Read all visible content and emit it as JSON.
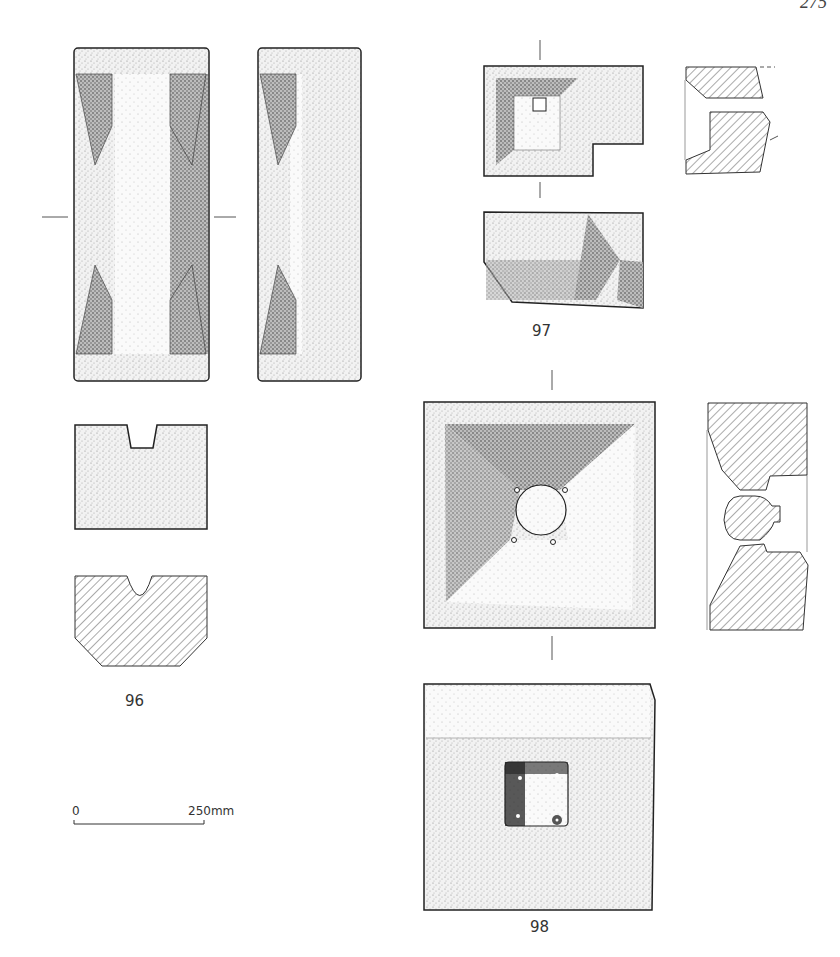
{
  "page": {
    "page_number": "275"
  },
  "figures": [
    {
      "id": "96",
      "label": "96",
      "views": [
        "face-elevation",
        "side-elevation",
        "end-elevation",
        "cross-section"
      ]
    },
    {
      "id": "97",
      "label": "97",
      "views": [
        "plan",
        "elevation",
        "section"
      ]
    },
    {
      "id": "98",
      "label": "98",
      "views": [
        "face-with-recess",
        "section",
        "reverse-face-with-socket"
      ]
    }
  ],
  "scale_bar": {
    "start_label": "0",
    "end_label": "250mm"
  },
  "colors": {
    "ink": "#222222",
    "stipple": "#777777",
    "background": "#ffffff"
  }
}
